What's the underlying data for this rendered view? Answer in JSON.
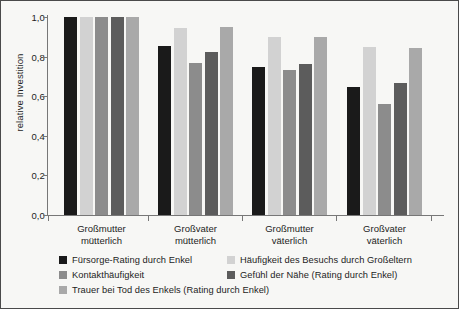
{
  "chart_data": {
    "type": "bar",
    "title": "",
    "xlabel": "",
    "ylabel": "relative Investition",
    "ylim": [
      0.0,
      1.0
    ],
    "grid": false,
    "legend_position": "bottom",
    "ytick_labels": [
      "1,0",
      "0,8",
      "0,6",
      "0,4",
      "0,2",
      "0,0"
    ],
    "ytick_values": [
      1.0,
      0.8,
      0.6,
      0.4,
      0.2,
      0.0
    ],
    "categories": [
      "Großmutter mütterlich",
      "Großvater mütterlich",
      "Großmutter väterlich",
      "Großvater väterlich"
    ],
    "category_lines": [
      [
        "Großmutter",
        "mütterlich"
      ],
      [
        "Großvater",
        "mütterlich"
      ],
      [
        "Großmutter",
        "väterlich"
      ],
      [
        "Großvater",
        "väterlich"
      ]
    ],
    "series": [
      {
        "name": "Fürsorge-Rating durch Enkel",
        "color": "#1a1a1a",
        "values": [
          1.0,
          0.855,
          0.75,
          0.645
        ]
      },
      {
        "name": "Häufigkeit des Besuchs durch Großeltern",
        "color": "#d2d2d2",
        "values": [
          1.0,
          0.945,
          0.9,
          0.85
        ]
      },
      {
        "name": "Kontakthäufigkeit",
        "color": "#8c8c8c",
        "values": [
          1.0,
          0.77,
          0.73,
          0.56
        ]
      },
      {
        "name": "Gefühl der Nähe (Rating durch Enkel)",
        "color": "#5c5c5c",
        "values": [
          1.0,
          0.825,
          0.765,
          0.665
        ]
      },
      {
        "name": "Trauer bei Tod des Enkels (Rating durch Enkel)",
        "color": "#a9a9a9",
        "values": [
          1.0,
          0.95,
          0.9,
          0.845
        ]
      }
    ]
  },
  "legend": {
    "rows": [
      {
        "left": {
          "label": "Fürsorge-Rating durch Enkel",
          "color": "#1a1a1a"
        },
        "right": {
          "label": "Häufigkeit des Besuchs durch Großeltern",
          "color": "#d2d2d2"
        }
      },
      {
        "left": {
          "label": "Kontakthäufigkeit",
          "color": "#8c8c8c"
        },
        "right": {
          "label": "Gefühl der Nähe (Rating durch Enkel)",
          "color": "#5c5c5c"
        }
      },
      {
        "left": {
          "label": "Trauer bei Tod des Enkels (Rating durch Enkel)",
          "color": "#a9a9a9"
        },
        "right": null
      }
    ]
  },
  "colors": {
    "background": "#f7f7f5",
    "border": "#4a4a4a",
    "axis": "#777777",
    "text": "#1d1d1d"
  }
}
